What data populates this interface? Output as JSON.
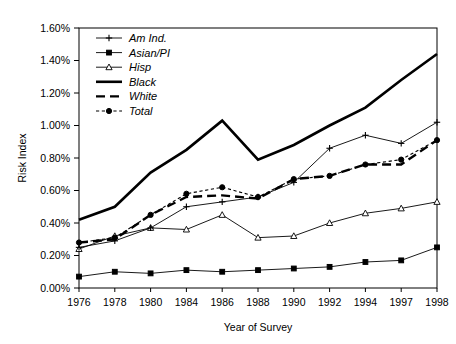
{
  "chart_data": {
    "type": "line",
    "title": "",
    "xlabel": "Year of Survey",
    "ylabel": "Risk Index",
    "categories": [
      "1976",
      "1978",
      "1980",
      "1984",
      "1986",
      "1988",
      "1990",
      "1992",
      "1994",
      "1997",
      "1998"
    ],
    "ylim": [
      0.0,
      1.6
    ],
    "ytick_labels": [
      "0.00%",
      "0.20%",
      "0.40%",
      "0.60%",
      "0.80%",
      "1.00%",
      "1.20%",
      "1.40%",
      "1.60%"
    ],
    "ytick_values": [
      0.0,
      0.2,
      0.4,
      0.6,
      0.8,
      1.0,
      1.2,
      1.4,
      1.6
    ],
    "yunit": "%",
    "grid": false,
    "legend_position": "top-left",
    "series": [
      {
        "name": "Am Ind.",
        "marker": "plus",
        "style": "solid",
        "width": "thin",
        "values": [
          0.25,
          0.29,
          0.37,
          0.5,
          0.53,
          0.56,
          0.65,
          0.86,
          0.94,
          0.89,
          1.02
        ]
      },
      {
        "name": "Asian/PI",
        "marker": "square",
        "style": "solid",
        "width": "thin",
        "values": [
          0.07,
          0.1,
          0.09,
          0.11,
          0.1,
          0.11,
          0.12,
          0.13,
          0.16,
          0.17,
          0.25
        ]
      },
      {
        "name": "Hisp",
        "marker": "triangle",
        "style": "solid",
        "width": "thin",
        "values": [
          0.24,
          0.32,
          0.37,
          0.36,
          0.45,
          0.31,
          0.32,
          0.4,
          0.46,
          0.49,
          0.53
        ]
      },
      {
        "name": "Black",
        "marker": "none",
        "style": "solid",
        "width": "thick",
        "values": [
          0.42,
          0.5,
          0.71,
          0.85,
          1.03,
          0.79,
          0.88,
          1.0,
          1.11,
          1.28,
          1.44
        ]
      },
      {
        "name": "White",
        "marker": "none",
        "style": "dashed",
        "width": "med",
        "values": [
          0.28,
          0.3,
          0.45,
          0.56,
          0.57,
          0.55,
          0.67,
          0.69,
          0.76,
          0.76,
          0.91
        ]
      },
      {
        "name": "Total",
        "marker": "circle",
        "style": "dotted",
        "width": "dot",
        "values": [
          0.28,
          0.31,
          0.45,
          0.58,
          0.62,
          0.56,
          0.67,
          0.69,
          0.76,
          0.79,
          0.91
        ]
      }
    ]
  }
}
